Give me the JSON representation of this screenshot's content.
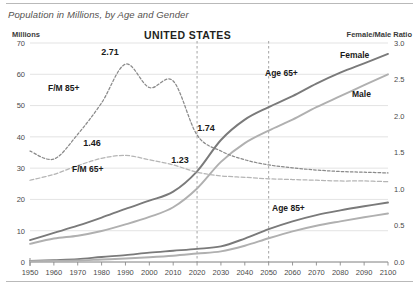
{
  "caption": "Population in Millions, by Age and Gender",
  "title": "UNITED STATES",
  "axes": {
    "left_title": "Millions",
    "right_title": "Female/Male Ratio"
  },
  "series_labels": {
    "female": "Female",
    "male": "Male",
    "age65": "Age 65+",
    "age85": "Age 85+",
    "fm85": "F/M 85+",
    "fm65": "F/M 65+"
  },
  "annotations": {
    "peak_fm85": "2.71",
    "fm65_1990": "1.46",
    "fm65_2020": "1.23",
    "fm85_2020": "1.74"
  },
  "colors": {
    "female_line": "#7a7a7a",
    "male_line": "#b0b0b0",
    "fm85_dash": "#8a8a8a",
    "fm65_dash": "#b5b5b5",
    "grid": "#dcdcdc",
    "axis": "#8c8c8c",
    "refline": "#9a9a9a",
    "rule": "#b9b9b9"
  },
  "chart_data": {
    "type": "line",
    "title": "UNITED STATES",
    "subtitle": "Population in Millions, by Age and Gender",
    "xlabel": "",
    "ylabel": "Millions",
    "y2label": "Female/Male Ratio",
    "xlim": [
      1950,
      2100
    ],
    "ylim": [
      0,
      70
    ],
    "y2lim": [
      0.0,
      3.0
    ],
    "grid": true,
    "legend": "inline-labels",
    "xticks": [
      1950,
      1960,
      1970,
      1980,
      1990,
      2000,
      2010,
      2020,
      2030,
      2040,
      2050,
      2060,
      2070,
      2080,
      2090,
      2100
    ],
    "yticks": [
      0,
      10,
      20,
      30,
      40,
      50,
      60,
      70
    ],
    "y2ticks": [
      0.0,
      0.5,
      1.0,
      1.5,
      2.0,
      2.5,
      3.0
    ],
    "reference_lines": [
      2020,
      2050
    ],
    "x": [
      1950,
      1960,
      1970,
      1980,
      1990,
      2000,
      2010,
      2020,
      2030,
      2040,
      2050,
      2060,
      2070,
      2080,
      2090,
      2100
    ],
    "series": [
      {
        "name": "Age 65+ Female",
        "axis": "left",
        "style": "solid",
        "color": "#7a7a7a",
        "values": [
          7.0,
          9.3,
          11.6,
          14.2,
          17.0,
          19.6,
          22.5,
          29.0,
          39.0,
          45.5,
          49.5,
          53.0,
          57.0,
          60.5,
          63.5,
          66.5
        ]
      },
      {
        "name": "Age 65+ Male",
        "axis": "left",
        "style": "solid",
        "color": "#b0b0b0",
        "values": [
          5.8,
          7.5,
          8.4,
          9.9,
          12.0,
          14.4,
          17.5,
          23.5,
          32.0,
          38.0,
          42.0,
          45.5,
          49.5,
          53.0,
          56.5,
          60.0
        ]
      },
      {
        "name": "Age 85+ Female",
        "axis": "left",
        "style": "solid",
        "color": "#7a7a7a",
        "values": [
          0.35,
          0.6,
          0.9,
          1.6,
          2.2,
          3.0,
          3.6,
          4.2,
          5.0,
          7.5,
          10.5,
          13.0,
          15.0,
          16.5,
          17.8,
          19.0
        ]
      },
      {
        "name": "Age 85+ Male",
        "axis": "left",
        "style": "solid",
        "color": "#b0b0b0",
        "values": [
          0.25,
          0.35,
          0.5,
          0.8,
          1.1,
          1.5,
          2.0,
          2.7,
          3.4,
          5.2,
          7.6,
          9.8,
          11.6,
          13.0,
          14.3,
          15.5
        ]
      },
      {
        "name": "F/M 85+",
        "axis": "right",
        "style": "dashed",
        "color": "#8a8a8a",
        "values": [
          1.52,
          1.41,
          1.75,
          2.18,
          2.71,
          2.39,
          2.48,
          1.74,
          1.52,
          1.4,
          1.33,
          1.29,
          1.26,
          1.24,
          1.23,
          1.22
        ]
      },
      {
        "name": "F/M 65+",
        "axis": "right",
        "style": "dashed",
        "color": "#b5b5b5",
        "values": [
          1.12,
          1.2,
          1.32,
          1.42,
          1.46,
          1.4,
          1.33,
          1.23,
          1.18,
          1.16,
          1.14,
          1.13,
          1.12,
          1.11,
          1.11,
          1.1
        ]
      }
    ],
    "annotations": [
      {
        "text": "2.71",
        "x": 1990,
        "y2": 2.71
      },
      {
        "text": "1.46",
        "x": 1990,
        "y2": 1.46
      },
      {
        "text": "1.23",
        "x": 2020,
        "y2": 1.23
      },
      {
        "text": "1.74",
        "x": 2020,
        "y2": 1.74
      }
    ]
  }
}
